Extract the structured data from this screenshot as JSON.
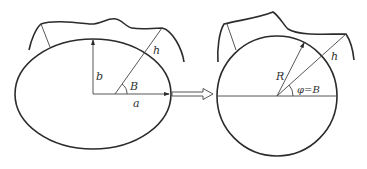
{
  "diagram": {
    "left_figure": {
      "shape": "ellipse",
      "labels": {
        "semi_minor_axis": "b",
        "semi_major_axis": "a",
        "latitude_angle": "B",
        "height": "h"
      }
    },
    "transform_arrow": {
      "style": "hollow-double-line-arrow",
      "direction": "right"
    },
    "right_figure": {
      "shape": "circle",
      "labels": {
        "radius": "R",
        "angle": "φ=B",
        "height": "h"
      }
    },
    "colors": {
      "line": "#2b2b2b",
      "background": "#ffffff"
    }
  }
}
